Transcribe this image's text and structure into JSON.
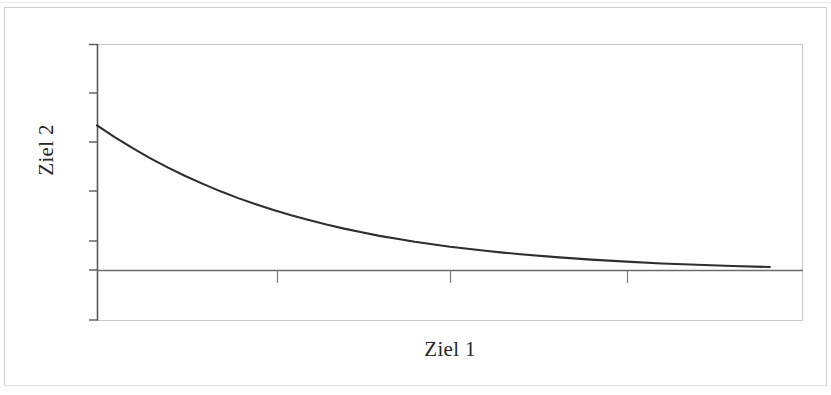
{
  "page": {
    "background_color": "#ffffff",
    "border_color": "#cfcfcf"
  },
  "figure": {
    "axis_color": "#4a4a4a",
    "frame_color": "#c8c8c8",
    "curve_color": "#2e2e2e",
    "xlabel": "Ziel 1",
    "ylabel": "Ziel 2"
  },
  "chart_data": {
    "type": "line",
    "title": "",
    "subtitle": "",
    "xlabel": "Ziel 1",
    "ylabel": "Ziel 2",
    "grid": false,
    "legend": null,
    "legend_position": "none",
    "xlim": [
      0,
      1
    ],
    "ylim": [
      0,
      1
    ],
    "xticks": [
      0.255,
      0.5,
      0.75
    ],
    "xticklabels": [
      "",
      "",
      ""
    ],
    "yticks": [
      0.0,
      0.18,
      0.36,
      0.545,
      0.725,
      0.91
    ],
    "yticklabels": [
      "",
      "",
      "",
      "",
      "",
      ""
    ],
    "annotations": [],
    "series": [
      {
        "name": "Pareto front",
        "color": "#2e2e2e",
        "linewidth": 2,
        "x": [
          0.0,
          0.025,
          0.05,
          0.075,
          0.1,
          0.125,
          0.15,
          0.175,
          0.2,
          0.225,
          0.25,
          0.275,
          0.3,
          0.325,
          0.35,
          0.375,
          0.4,
          0.425,
          0.45,
          0.475,
          0.5,
          0.525,
          0.55,
          0.575,
          0.6,
          0.65,
          0.7,
          0.75,
          0.8,
          0.85,
          0.9,
          0.953
        ],
        "y": [
          0.64,
          0.588,
          0.54,
          0.495,
          0.454,
          0.416,
          0.381,
          0.348,
          0.318,
          0.291,
          0.265,
          0.242,
          0.221,
          0.201,
          0.183,
          0.167,
          0.151,
          0.138,
          0.125,
          0.114,
          0.103,
          0.094,
          0.085,
          0.077,
          0.07,
          0.057,
          0.046,
          0.037,
          0.029,
          0.023,
          0.018,
          0.013
        ]
      }
    ]
  }
}
